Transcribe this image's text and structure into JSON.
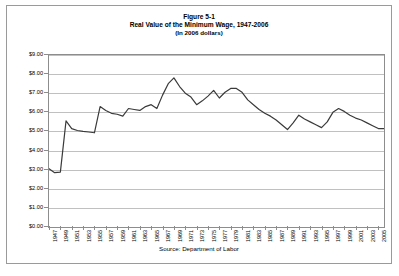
{
  "figure": {
    "title_line1": "Figure 5-1",
    "title_line2": "Real Value of the Minimum Wage, 1947-2006",
    "title_line3": "(In 2006 dollars)",
    "source": "Source: Department of Labor"
  },
  "chart_data": {
    "type": "line",
    "title": "Real Value of the Minimum Wage, 1947-2006",
    "subtitle": "(In 2006 dollars)",
    "xlabel": "",
    "ylabel": "",
    "ylim": [
      0,
      9
    ],
    "ytick_step": 1,
    "ytick_labels": [
      "$9.00",
      "$8.00",
      "$7.00",
      "$6.00",
      "$5.00",
      "$4.00",
      "$3.00",
      "$2.00",
      "$1.00",
      "$0.00"
    ],
    "ytick_values": [
      9,
      8,
      7,
      6,
      5,
      4,
      3,
      2,
      1,
      0
    ],
    "xlim": [
      1947,
      2006
    ],
    "xtick_labels": [
      "1947",
      "1949",
      "1951",
      "1953",
      "1955",
      "1957",
      "1959",
      "1961",
      "1963",
      "1965",
      "1967",
      "1969",
      "1971",
      "1973",
      "1975",
      "1977",
      "1979",
      "1981",
      "1983",
      "1985",
      "1987",
      "1989",
      "1991",
      "1993",
      "1995",
      "1997",
      "1999",
      "2001",
      "2003",
      "2005"
    ],
    "xtick_values": [
      1947,
      1949,
      1951,
      1953,
      1955,
      1957,
      1959,
      1961,
      1963,
      1965,
      1967,
      1969,
      1971,
      1973,
      1975,
      1977,
      1979,
      1981,
      1983,
      1985,
      1987,
      1989,
      1991,
      1993,
      1995,
      1997,
      1999,
      2001,
      2003,
      2005
    ],
    "grid": true,
    "legend": "none",
    "line_color": "#3a3a3a",
    "x": [
      1947,
      1948,
      1949,
      1950,
      1951,
      1952,
      1953,
      1954,
      1955,
      1956,
      1957,
      1958,
      1959,
      1960,
      1961,
      1962,
      1963,
      1964,
      1965,
      1966,
      1967,
      1968,
      1969,
      1970,
      1971,
      1972,
      1973,
      1974,
      1975,
      1976,
      1977,
      1978,
      1979,
      1980,
      1981,
      1982,
      1983,
      1984,
      1985,
      1986,
      1987,
      1988,
      1989,
      1990,
      1991,
      1992,
      1993,
      1994,
      1995,
      1996,
      1997,
      1998,
      1999,
      2000,
      2001,
      2002,
      2003,
      2004,
      2005,
      2006
    ],
    "values": [
      3.05,
      2.84,
      2.87,
      5.55,
      5.15,
      5.05,
      5.0,
      4.97,
      4.93,
      6.3,
      6.1,
      5.95,
      5.9,
      5.8,
      6.2,
      6.15,
      6.1,
      6.3,
      6.4,
      6.2,
      6.9,
      7.5,
      7.8,
      7.35,
      7.0,
      6.8,
      6.4,
      6.6,
      6.85,
      7.15,
      6.75,
      7.05,
      7.25,
      7.25,
      7.05,
      6.65,
      6.4,
      6.15,
      5.95,
      5.8,
      5.6,
      5.35,
      5.1,
      5.45,
      5.85,
      5.65,
      5.5,
      5.35,
      5.2,
      5.5,
      6.0,
      6.2,
      6.05,
      5.85,
      5.7,
      5.6,
      5.45,
      5.3,
      5.15,
      5.15
    ],
    "series": [
      {
        "name": "Real minimum wage (2006 dollars)",
        "values": [
          3.05,
          2.84,
          2.87,
          5.55,
          5.15,
          5.05,
          5.0,
          4.97,
          4.93,
          6.3,
          6.1,
          5.95,
          5.9,
          5.8,
          6.2,
          6.15,
          6.1,
          6.3,
          6.4,
          6.2,
          6.9,
          7.5,
          7.8,
          7.35,
          7.0,
          6.8,
          6.4,
          6.6,
          6.85,
          7.15,
          6.75,
          7.05,
          7.25,
          7.25,
          7.05,
          6.65,
          6.4,
          6.15,
          5.95,
          5.8,
          5.6,
          5.35,
          5.1,
          5.45,
          5.85,
          5.65,
          5.5,
          5.35,
          5.2,
          5.5,
          6.0,
          6.2,
          6.05,
          5.85,
          5.7,
          5.6,
          5.45,
          5.3,
          5.15,
          5.15
        ]
      }
    ]
  }
}
